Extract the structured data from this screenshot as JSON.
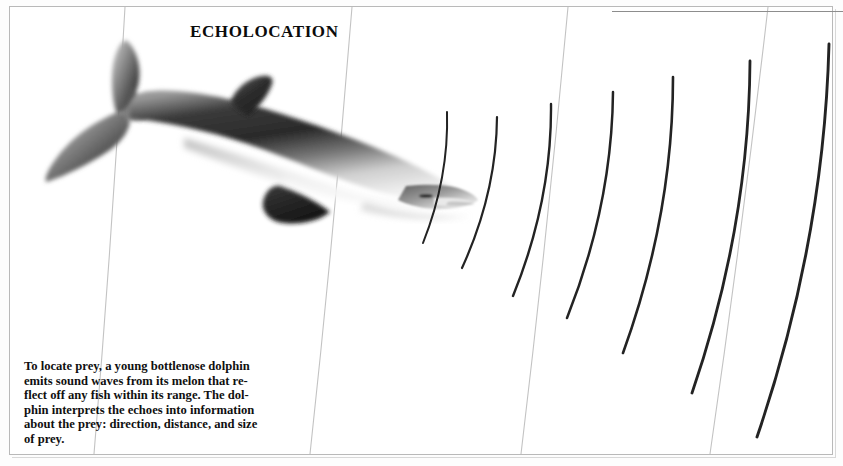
{
  "page": {
    "width": 843,
    "height": 466,
    "background": "#ffffff",
    "border_color": "#b9b9b9"
  },
  "title": {
    "text": "ECHOLOCATION",
    "x": 190,
    "y": 22,
    "color": "#0b0b0b",
    "style": "bold serif small-caps"
  },
  "caption": {
    "text": "To locate prey, a young bottlenose dolphin emits sound waves from its melon that reflect off any fish within its range. The dolphin interprets the echoes into information about the prey: direction, distance, and size of prey.",
    "lines": [
      "To locate prey, a young bottlenose dolphin",
      "emits sound waves from its melon that re-",
      "flect off any fish within its range. The dol-",
      "phin interprets the echoes into information",
      "about the prey: direction, distance, and size",
      "of prey."
    ],
    "color": "#101010",
    "x": 24,
    "y": 359
  },
  "illustration": {
    "subject": "bottlenose-dolphin",
    "description": "Grayscale airbrush illustration of a bottlenose dolphin facing right, tail flukes at upper left, dorsal fin mid-body, pectoral fin below, rostrum and melon at right emitting sound.",
    "body_color_dark": "#2b2b2b",
    "body_color_mid": "#6f6f6f",
    "body_color_light": "#d9d9d9",
    "orientation": "head-right-tail-left"
  },
  "sound_waves": {
    "label": "echolocation sound wave arcs",
    "color": "#232323",
    "count": 9,
    "arcs": [
      {
        "id": 1,
        "x_top": 447,
        "y_top": 112,
        "x_bot": 423,
        "y_bot": 243,
        "bow": 14,
        "w": 2.0
      },
      {
        "id": 2,
        "x_top": 497,
        "y_top": 117,
        "x_bot": 462,
        "y_bot": 268,
        "bow": 17,
        "w": 2.2
      },
      {
        "id": 3,
        "x_top": 551,
        "y_top": 104,
        "x_bot": 513,
        "y_bot": 296,
        "bow": 20,
        "w": 2.4
      },
      {
        "id": 4,
        "x_top": 613,
        "y_top": 92,
        "x_bot": 567,
        "y_bot": 318,
        "bow": 22,
        "w": 2.5
      },
      {
        "id": 5,
        "x_top": 673,
        "y_top": 77,
        "x_bot": 623,
        "y_bot": 353,
        "bow": 25,
        "w": 2.6
      },
      {
        "id": 6,
        "x_top": 750,
        "y_top": 61,
        "x_bot": 692,
        "y_bot": 393,
        "bow": 28,
        "w": 2.8
      },
      {
        "id": 7,
        "x_top": 829,
        "y_top": 44,
        "x_bot": 757,
        "y_bot": 437,
        "bow": 31,
        "w": 2.9
      }
    ]
  },
  "grid_lines": {
    "label": "faint page ruling lines",
    "color": "#c3c3c3",
    "lines": [
      {
        "x_top": 125,
        "x_bot": 94
      },
      {
        "x_top": 352,
        "x_bot": 310
      },
      {
        "x_top": 568,
        "x_bot": 521
      },
      {
        "x_top": 768,
        "x_bot": 710
      }
    ]
  },
  "top_rule": {
    "label": "horizontal rule at top right",
    "color": "#8d8d8d"
  }
}
